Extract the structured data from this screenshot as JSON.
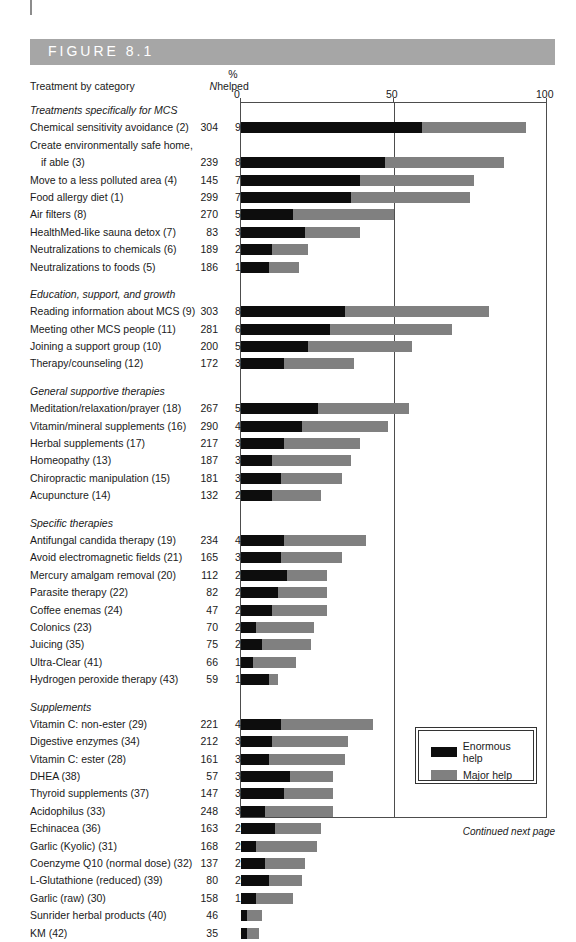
{
  "figure": {
    "label": "FIGURE 8.1",
    "footer": "Continued next page"
  },
  "headers": {
    "treatment": "Treatment by category",
    "n": "N",
    "pct_symbol": "%",
    "helped": "helped"
  },
  "axis": {
    "tick0": "0",
    "tick50": "50",
    "tick100": "100"
  },
  "legend": {
    "enormous": "Enormous help",
    "major": "Major help"
  },
  "colors": {
    "enormous": "#0d0d0d",
    "major": "#808080",
    "header_band": "#a6a6a6",
    "frame": "#4d4d4d"
  },
  "chart_data": {
    "type": "bar",
    "orientation": "horizontal",
    "stacked": true,
    "title": "FIGURE 8.1",
    "xlabel": "",
    "ylabel": "Treatment by category",
    "xlim": [
      0,
      100
    ],
    "xticks": [
      0,
      50,
      100
    ],
    "grid": false,
    "legend_position": "inside-bottom-right",
    "series": [
      {
        "name": "Enormous help",
        "color": "#0d0d0d"
      },
      {
        "name": "Major help",
        "color": "#808080"
      }
    ],
    "groups": [
      {
        "group": "Treatments specifically for MCS",
        "rows": [
          {
            "label": "Chemical sensitivity avoidance (2)",
            "n": "304",
            "pct": "93%",
            "total": 93,
            "enormous": 59,
            "major": 34
          },
          {
            "label": "Create environmentally safe home,",
            "label2": "if able (3)",
            "n": "239",
            "pct": "86%",
            "total": 86,
            "enormous": 47,
            "major": 39
          },
          {
            "label": "Move to a less polluted area (4)",
            "n": "145",
            "pct": "76%",
            "total": 76,
            "enormous": 39,
            "major": 37
          },
          {
            "label": "Food allergy diet (1)",
            "n": "299",
            "pct": "75%",
            "total": 75,
            "enormous": 36,
            "major": 39
          },
          {
            "label": "Air filters (8)",
            "n": "270",
            "pct": "50%",
            "total": 50,
            "enormous": 17,
            "major": 33
          },
          {
            "label": "HealthMed-like sauna detox (7)",
            "n": "83",
            "pct": "39%",
            "total": 39,
            "enormous": 21,
            "major": 18
          },
          {
            "label": "Neutralizations to chemicals (6)",
            "n": "189",
            "pct": "22%",
            "total": 22,
            "enormous": 10,
            "major": 12
          },
          {
            "label": "Neutralizations to foods (5)",
            "n": "186",
            "pct": "19%",
            "total": 19,
            "enormous": 9,
            "major": 10
          }
        ]
      },
      {
        "group": "Education, support, and growth",
        "rows": [
          {
            "label": "Reading information about MCS (9)",
            "n": "303",
            "pct": "81%",
            "total": 81,
            "enormous": 34,
            "major": 47
          },
          {
            "label": "Meeting other MCS people (11)",
            "n": "281",
            "pct": "69%",
            "total": 69,
            "enormous": 29,
            "major": 40
          },
          {
            "label": "Joining a support group (10)",
            "n": "200",
            "pct": "56%",
            "total": 56,
            "enormous": 22,
            "major": 34
          },
          {
            "label": "Therapy/counseling (12)",
            "n": "172",
            "pct": "37%",
            "total": 37,
            "enormous": 14,
            "major": 23
          }
        ]
      },
      {
        "group": "General supportive therapies",
        "rows": [
          {
            "label": "Meditation/relaxation/prayer (18)",
            "n": "267",
            "pct": "55%",
            "total": 55,
            "enormous": 25,
            "major": 30
          },
          {
            "label": "Vitamin/mineral supplements (16)",
            "n": "290",
            "pct": "48%",
            "total": 48,
            "enormous": 20,
            "major": 28
          },
          {
            "label": "Herbal supplements (17)",
            "n": "217",
            "pct": "39%",
            "total": 39,
            "enormous": 14,
            "major": 25
          },
          {
            "label": "Homeopathy (13)",
            "n": "187",
            "pct": "36%",
            "total": 36,
            "enormous": 10,
            "major": 26
          },
          {
            "label": "Chiropractic manipulation (15)",
            "n": "181",
            "pct": "33%",
            "total": 33,
            "enormous": 13,
            "major": 20
          },
          {
            "label": "Acupuncture (14)",
            "n": "132",
            "pct": "26%",
            "total": 26,
            "enormous": 10,
            "major": 16
          }
        ]
      },
      {
        "group": "Specific therapies",
        "rows": [
          {
            "label": "Antifungal candida therapy (19)",
            "n": "234",
            "pct": "41%",
            "total": 41,
            "enormous": 14,
            "major": 27
          },
          {
            "label": "Avoid electromagnetic fields (21)",
            "n": "165",
            "pct": "33%",
            "total": 33,
            "enormous": 13,
            "major": 20
          },
          {
            "label": "Mercury amalgam removal (20)",
            "n": "112",
            "pct": "28%",
            "total": 28,
            "enormous": 15,
            "major": 13
          },
          {
            "label": "Parasite therapy (22)",
            "n": "82",
            "pct": "28%",
            "total": 28,
            "enormous": 12,
            "major": 16
          },
          {
            "label": "Coffee enemas (24)",
            "n": "47",
            "pct": "28%",
            "total": 28,
            "enormous": 10,
            "major": 18
          },
          {
            "label": "Colonics (23)",
            "n": "70",
            "pct": "24%",
            "total": 24,
            "enormous": 5,
            "major": 19
          },
          {
            "label": "Juicing (35)",
            "n": "75",
            "pct": "23%",
            "total": 23,
            "enormous": 7,
            "major": 16
          },
          {
            "label": "Ultra-Clear (41)",
            "n": "66",
            "pct": "18%",
            "total": 18,
            "enormous": 4,
            "major": 14
          },
          {
            "label": "Hydrogen peroxide therapy (43)",
            "n": "59",
            "pct": "12%",
            "total": 12,
            "enormous": 9,
            "major": 3
          }
        ]
      },
      {
        "group": "Supplements",
        "rows": [
          {
            "label": "Vitamin C: non-ester (29)",
            "n": "221",
            "pct": "43%",
            "total": 43,
            "enormous": 13,
            "major": 30
          },
          {
            "label": "Digestive enzymes (34)",
            "n": "212",
            "pct": "35%",
            "total": 35,
            "enormous": 10,
            "major": 25
          },
          {
            "label": "Vitamin C: ester (28)",
            "n": "161",
            "pct": "34%",
            "total": 34,
            "enormous": 9,
            "major": 25
          },
          {
            "label": "DHEA (38)",
            "n": "57",
            "pct": "30%",
            "total": 30,
            "enormous": 16,
            "major": 14
          },
          {
            "label": "Thyroid supplements (37)",
            "n": "147",
            "pct": "30%",
            "total": 30,
            "enormous": 14,
            "major": 16
          },
          {
            "label": "Acidophilus (33)",
            "n": "248",
            "pct": "30%",
            "total": 30,
            "enormous": 8,
            "major": 22
          },
          {
            "label": "Echinacea (36)",
            "n": "163",
            "pct": "26%",
            "total": 26,
            "enormous": 11,
            "major": 15
          },
          {
            "label": "Garlic (Kyolic) (31)",
            "n": "168",
            "pct": "25%",
            "total": 25,
            "enormous": 5,
            "major": 20
          },
          {
            "label": "Coenzyme Q10 (normal dose) (32)",
            "n": "137",
            "pct": "21%",
            "total": 21,
            "enormous": 8,
            "major": 13
          },
          {
            "label": "L-Glutathione (reduced) (39)",
            "n": "80",
            "pct": "20%",
            "total": 20,
            "enormous": 9,
            "major": 11
          },
          {
            "label": "Garlic (raw) (30)",
            "n": "158",
            "pct": "17%",
            "total": 17,
            "enormous": 5,
            "major": 12
          },
          {
            "label": "Sunrider herbal products (40)",
            "n": "46",
            "pct": "7%",
            "total": 7,
            "enormous": 2,
            "major": 5
          },
          {
            "label": "KM (42)",
            "n": "35",
            "pct": "6%",
            "total": 6,
            "enormous": 2,
            "major": 4
          }
        ]
      }
    ]
  }
}
